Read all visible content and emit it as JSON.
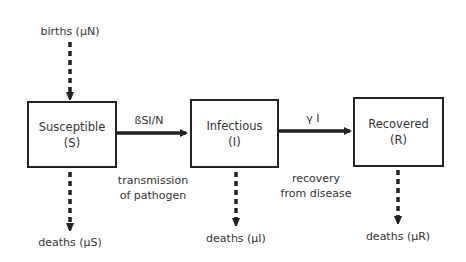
{
  "diagram": {
    "type": "SIR compartmental model flow diagram",
    "compartments": [
      {
        "id": "S",
        "name": "Susceptible",
        "symbol": "(S)"
      },
      {
        "id": "I",
        "name": "Infectious",
        "symbol": "(I)"
      },
      {
        "id": "R",
        "name": "Recovered",
        "symbol": "(R)"
      }
    ],
    "inflow": {
      "label": "births (μN)",
      "target": "S"
    },
    "transitions": [
      {
        "from": "S",
        "to": "I",
        "rate_label": "ßSI/N",
        "description_line1": "transmission",
        "description_line2": "of pathogen"
      },
      {
        "from": "I",
        "to": "R",
        "rate_label": "γ I",
        "description_line1": "recovery",
        "description_line2": "from disease"
      }
    ],
    "outflows": [
      {
        "from": "S",
        "label": "deaths (μS)"
      },
      {
        "from": "I",
        "label": "deaths (μI)"
      },
      {
        "from": "R",
        "label": "deaths (μR)"
      }
    ],
    "colors": {
      "stroke": "#222222",
      "text": "#333333",
      "background": "#ffffff"
    }
  }
}
